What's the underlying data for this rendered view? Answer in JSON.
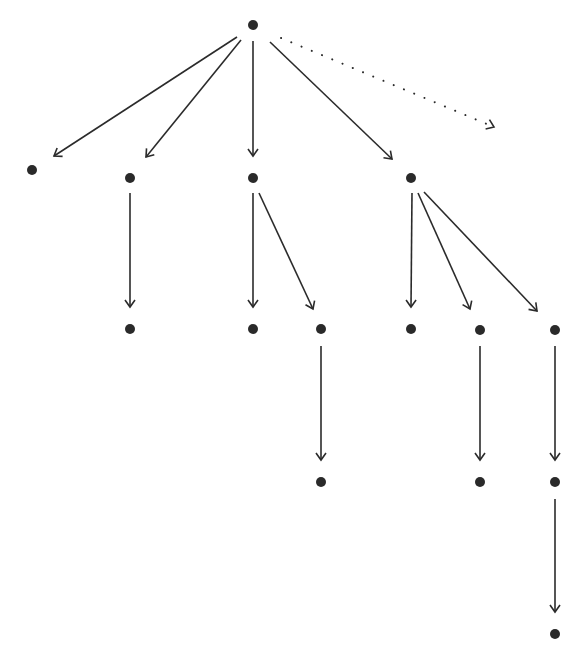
{
  "diagram": {
    "type": "tree",
    "colors": {
      "stroke": "#2b2b2b",
      "node": "#2a2a2a",
      "background": "#ffffff"
    },
    "nodes": [
      {
        "id": "root",
        "x": 253,
        "y": 25
      },
      {
        "id": "a",
        "x": 32,
        "y": 170
      },
      {
        "id": "b",
        "x": 130,
        "y": 178
      },
      {
        "id": "c",
        "x": 253,
        "y": 178
      },
      {
        "id": "d",
        "x": 411,
        "y": 178
      },
      {
        "id": "b1",
        "x": 130,
        "y": 329
      },
      {
        "id": "c1",
        "x": 253,
        "y": 329
      },
      {
        "id": "c2",
        "x": 321,
        "y": 329
      },
      {
        "id": "d1",
        "x": 411,
        "y": 329
      },
      {
        "id": "d2",
        "x": 480,
        "y": 330
      },
      {
        "id": "d3",
        "x": 555,
        "y": 330
      },
      {
        "id": "c2a",
        "x": 321,
        "y": 482
      },
      {
        "id": "d2a",
        "x": 480,
        "y": 482
      },
      {
        "id": "d3a",
        "x": 555,
        "y": 482
      },
      {
        "id": "d3b",
        "x": 555,
        "y": 634
      }
    ],
    "edges": [
      {
        "from": "root",
        "to": "a",
        "x1": 237,
        "y1": 37,
        "x2": 54,
        "y2": 156,
        "style": "solid"
      },
      {
        "from": "root",
        "to": "b",
        "x1": 241,
        "y1": 40,
        "x2": 146,
        "y2": 157,
        "style": "solid"
      },
      {
        "from": "root",
        "to": "c",
        "x1": 253,
        "y1": 41,
        "x2": 253,
        "y2": 156,
        "style": "solid"
      },
      {
        "from": "root",
        "to": "d",
        "x1": 270,
        "y1": 42,
        "x2": 392,
        "y2": 159,
        "style": "solid"
      },
      {
        "from": "root",
        "to": "unseen",
        "x1": 281,
        "y1": 38,
        "x2": 494,
        "y2": 127,
        "style": "dotted"
      },
      {
        "from": "b",
        "to": "b1",
        "x1": 130,
        "y1": 193,
        "x2": 130,
        "y2": 307,
        "style": "solid"
      },
      {
        "from": "c",
        "to": "c1",
        "x1": 253,
        "y1": 193,
        "x2": 253,
        "y2": 307,
        "style": "solid"
      },
      {
        "from": "c",
        "to": "c2",
        "x1": 259,
        "y1": 193,
        "x2": 313,
        "y2": 309,
        "style": "solid"
      },
      {
        "from": "d",
        "to": "d1",
        "x1": 412,
        "y1": 193,
        "x2": 411,
        "y2": 307,
        "style": "solid"
      },
      {
        "from": "d",
        "to": "d2",
        "x1": 418,
        "y1": 193,
        "x2": 470,
        "y2": 309,
        "style": "solid"
      },
      {
        "from": "d",
        "to": "d3",
        "x1": 424,
        "y1": 192,
        "x2": 537,
        "y2": 311,
        "style": "solid"
      },
      {
        "from": "c2",
        "to": "c2a",
        "x1": 321,
        "y1": 346,
        "x2": 321,
        "y2": 460,
        "style": "solid"
      },
      {
        "from": "d2",
        "to": "d2a",
        "x1": 480,
        "y1": 346,
        "x2": 480,
        "y2": 460,
        "style": "solid"
      },
      {
        "from": "d3",
        "to": "d3a",
        "x1": 555,
        "y1": 346,
        "x2": 555,
        "y2": 460,
        "style": "solid"
      },
      {
        "from": "d3a",
        "to": "d3b",
        "x1": 555,
        "y1": 499,
        "x2": 555,
        "y2": 612,
        "style": "solid"
      }
    ]
  }
}
